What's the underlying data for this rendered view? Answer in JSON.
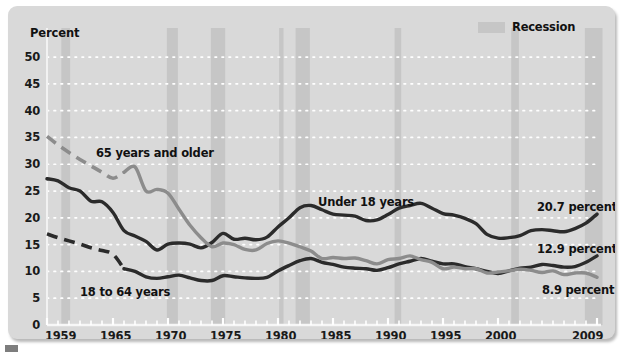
{
  "chart": {
    "axis_title": "Percent",
    "legend": {
      "label": "Recession",
      "swatch_color": "#c6c6c6"
    },
    "series_labels": {
      "older": "65 years and older",
      "working": "18 to 64 years",
      "children": "Under 18 years"
    },
    "end_values": {
      "children": "20.7 percent",
      "working": "12.9 percent",
      "older": "8.9 percent"
    }
  },
  "chart_data": {
    "type": "line",
    "title": "",
    "subtitle": "",
    "xlabel": "",
    "ylabel": "Percent",
    "xlim": [
      1959,
      2009
    ],
    "ylim": [
      0,
      53
    ],
    "yticks": [
      0,
      5,
      10,
      15,
      20,
      25,
      30,
      35,
      40,
      45,
      50
    ],
    "xticks": [
      1959,
      1965,
      1970,
      1975,
      1980,
      1985,
      1990,
      1995,
      2000,
      2009
    ],
    "xtick_labels": [
      "1959",
      "1965",
      "1970",
      "1975",
      "1980",
      "1985",
      "1990",
      "1995",
      "2000",
      "2009"
    ],
    "grid": "horizontal-dotted",
    "legend_position": "top-right",
    "colors": {
      "children": "#2b2b2b",
      "working": "#2b2b2b",
      "older": "#8c8c8c",
      "recession_band": "#c6c6c6",
      "plot_background": "#d9d9d9"
    },
    "x": [
      1959,
      1960,
      1961,
      1962,
      1963,
      1964,
      1965,
      1966,
      1967,
      1968,
      1969,
      1970,
      1971,
      1972,
      1973,
      1974,
      1975,
      1976,
      1977,
      1978,
      1979,
      1980,
      1981,
      1982,
      1983,
      1984,
      1985,
      1986,
      1987,
      1988,
      1989,
      1990,
      1991,
      1992,
      1993,
      1994,
      1995,
      1996,
      1997,
      1998,
      1999,
      2000,
      2001,
      2002,
      2003,
      2004,
      2005,
      2006,
      2007,
      2008,
      2009
    ],
    "series": [
      {
        "name": "Under 18 years",
        "color": "#2b2b2b",
        "style": "solid",
        "end_value": 20.7,
        "values": [
          27.3,
          26.9,
          25.6,
          25.0,
          23.1,
          23.0,
          21.0,
          17.6,
          16.6,
          15.6,
          14.0,
          15.1,
          15.3,
          15.1,
          14.4,
          15.4,
          17.1,
          16.0,
          16.2,
          15.9,
          16.4,
          18.3,
          20.0,
          21.9,
          22.3,
          21.5,
          20.7,
          20.5,
          20.3,
          19.5,
          19.6,
          20.6,
          21.8,
          22.3,
          22.7,
          21.8,
          20.8,
          20.5,
          19.9,
          18.9,
          16.9,
          16.2,
          16.3,
          16.7,
          17.6,
          17.8,
          17.6,
          17.4,
          18.0,
          19.0,
          20.7
        ]
      },
      {
        "name": "18 to 64 years",
        "color": "#2b2b2b",
        "style": "dashed-then-solid",
        "dashed_until": 1966,
        "end_value": 12.9,
        "values": [
          17.0,
          16.3,
          15.7,
          15.1,
          14.4,
          13.9,
          13.2,
          10.5,
          10.0,
          9.0,
          8.7,
          9.0,
          9.3,
          8.8,
          8.3,
          8.3,
          9.2,
          9.0,
          8.8,
          8.7,
          8.9,
          10.1,
          11.1,
          12.0,
          12.4,
          11.7,
          11.3,
          10.8,
          10.6,
          10.5,
          10.2,
          10.7,
          11.4,
          11.9,
          12.4,
          11.9,
          11.4,
          11.4,
          10.9,
          10.5,
          10.0,
          9.6,
          10.1,
          10.6,
          10.8,
          11.3,
          11.1,
          10.8,
          10.9,
          11.7,
          12.9
        ]
      },
      {
        "name": "65 years and older",
        "color": "#8c8c8c",
        "style": "dashed-then-solid",
        "dashed_until": 1966,
        "end_value": 8.9,
        "values": [
          35.2,
          33.6,
          32.2,
          30.9,
          29.7,
          28.5,
          27.4,
          28.5,
          29.5,
          25.0,
          25.3,
          24.6,
          21.6,
          18.6,
          16.3,
          14.6,
          15.3,
          15.0,
          14.1,
          14.0,
          15.2,
          15.7,
          15.3,
          14.6,
          13.8,
          12.4,
          12.6,
          12.4,
          12.5,
          12.0,
          11.4,
          12.2,
          12.4,
          12.9,
          12.2,
          11.7,
          10.5,
          10.8,
          10.5,
          10.5,
          9.7,
          9.9,
          10.1,
          10.4,
          10.2,
          9.8,
          10.1,
          9.4,
          9.7,
          9.7,
          8.9
        ]
      }
    ],
    "recession_bands": [
      {
        "start": 1960.3,
        "end": 1961.1
      },
      {
        "start": 1969.9,
        "end": 1970.9
      },
      {
        "start": 1973.9,
        "end": 1975.2
      },
      {
        "start": 1980.1,
        "end": 1980.5
      },
      {
        "start": 1981.6,
        "end": 1982.9
      },
      {
        "start": 1990.6,
        "end": 1991.2
      },
      {
        "start": 2001.2,
        "end": 2001.9
      },
      {
        "start": 2007.9,
        "end": 2009.5
      }
    ]
  }
}
